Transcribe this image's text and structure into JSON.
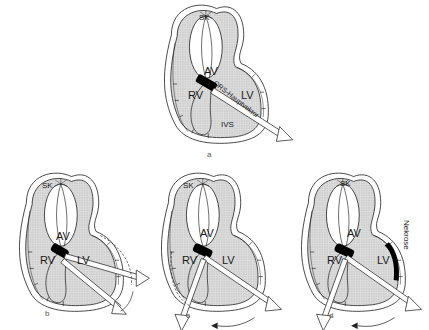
{
  "figure": {
    "panels": [
      {
        "id": "a",
        "caption": "a",
        "labels": {
          "sk": "SK",
          "av": "AV",
          "rv": "RV",
          "lv": "LV",
          "ivs": "IVS",
          "vector": "QRS-Hauptvektor"
        }
      },
      {
        "id": "b",
        "caption": "b",
        "labels": {
          "sk": "SK",
          "av": "AV",
          "rv": "RV",
          "lv": "LV"
        }
      },
      {
        "id": "c",
        "caption": "c",
        "labels": {
          "sk": "SK",
          "av": "AV",
          "rv": "RV",
          "lv": "LV"
        }
      },
      {
        "id": "d",
        "caption": "d",
        "labels": {
          "sk": "SK",
          "av": "AV",
          "rv": "RV",
          "lv": "LV",
          "necrosis": "Nekrose"
        }
      }
    ],
    "colors": {
      "tissue_fill": "#d9d9d9",
      "outline": "#222222",
      "node_fill": "#000000",
      "arrow_fill": "#ffffff",
      "necrosis_fill": "#000000"
    }
  }
}
